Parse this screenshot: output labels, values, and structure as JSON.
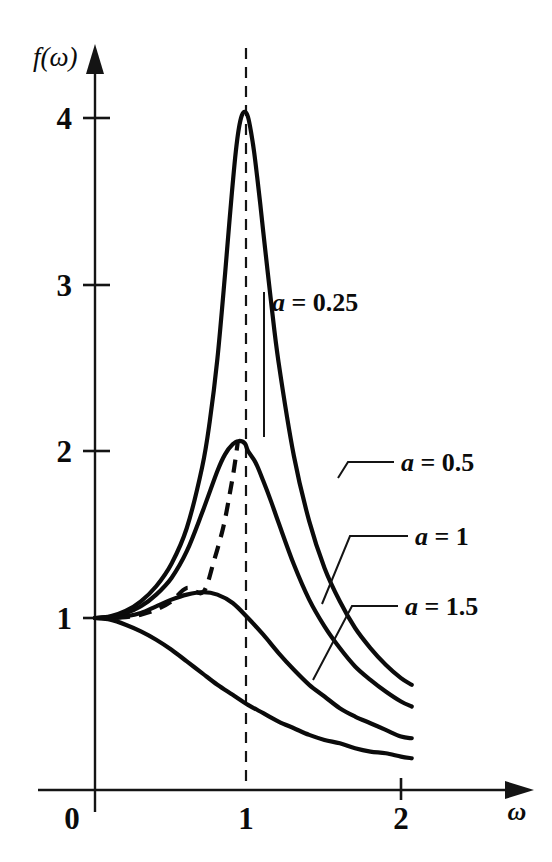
{
  "figure": {
    "name": "resonance-response-curves",
    "background_color": "#ffffff",
    "ink_color": "#0b0b0b"
  },
  "axes": {
    "y_title": "f(ω)",
    "x_title": "ω",
    "origin_label": "0",
    "y_ticks": [
      "1",
      "2",
      "3",
      "4"
    ],
    "x_ticks": [
      "1",
      "2"
    ]
  },
  "annotations": {
    "label_a_025": {
      "lhs": "a",
      "eq": " = ",
      "rhs": "0.25"
    },
    "label_a_05": {
      "lhs": "a",
      "eq": " = ",
      "rhs": "0.5"
    },
    "label_a_1": {
      "lhs": "a",
      "eq": " = ",
      "rhs": "1"
    },
    "label_a_15": {
      "lhs": "a",
      "eq": " = ",
      "rhs": "1.5"
    },
    "resonance_line": "ω = 1 dashed reference line",
    "locus": "dashed locus of maxima"
  },
  "chart_data": {
    "type": "line",
    "title": "",
    "xlabel": "ω",
    "ylabel": "f(ω)",
    "xlim": [
      0,
      2.2
    ],
    "ylim": [
      0,
      4.45
    ],
    "grid": false,
    "legend_position": "inline-labels",
    "x_ticks": [
      0,
      1,
      2
    ],
    "y_ticks": [
      1,
      2,
      3,
      4
    ],
    "formula": "f(w) = 1 / sqrt((1 - w^2)^2 + (a*w)^2)",
    "series": [
      {
        "name": "a = 0.25",
        "a": 0.25,
        "label": "a = 0.25",
        "style": "solid",
        "peak": {
          "x": 0.984,
          "y": 4.03
        },
        "x": [
          0,
          0.1,
          0.2,
          0.3,
          0.4,
          0.5,
          0.6,
          0.7,
          0.75,
          0.8,
          0.85,
          0.88,
          0.9,
          0.92,
          0.94,
          0.96,
          0.98,
          1.0,
          1.02,
          1.04,
          1.06,
          1.08,
          1.1,
          1.15,
          1.2,
          1.3,
          1.4,
          1.5,
          1.6,
          1.7,
          1.8,
          1.9,
          2.0,
          2.07
        ],
        "y": [
          1.0,
          1.01,
          1.042,
          1.1,
          1.19,
          1.325,
          1.539,
          1.902,
          2.177,
          2.552,
          3.059,
          3.39,
          3.6,
          3.79,
          3.93,
          4.01,
          4.031,
          4.0,
          3.91,
          3.79,
          3.64,
          3.48,
          3.31,
          2.9,
          2.53,
          1.97,
          1.58,
          1.3,
          1.1,
          0.94,
          0.82,
          0.72,
          0.64,
          0.6
        ]
      },
      {
        "name": "a = 0.5",
        "a": 0.5,
        "label": "a = 0.5",
        "style": "solid",
        "peak": {
          "x": 0.935,
          "y": 2.066
        },
        "x": [
          0,
          0.1,
          0.2,
          0.3,
          0.4,
          0.5,
          0.6,
          0.7,
          0.8,
          0.85,
          0.9,
          0.94,
          0.98,
          1.0,
          1.05,
          1.1,
          1.15,
          1.2,
          1.3,
          1.4,
          1.5,
          1.6,
          1.7,
          1.8,
          1.9,
          2.0,
          2.07
        ],
        "y": [
          1.0,
          1.007,
          1.028,
          1.07,
          1.14,
          1.24,
          1.4,
          1.63,
          1.88,
          1.98,
          2.04,
          2.06,
          2.045,
          2.0,
          1.93,
          1.82,
          1.7,
          1.57,
          1.32,
          1.11,
          0.95,
          0.82,
          0.71,
          0.63,
          0.56,
          0.5,
          0.47
        ]
      },
      {
        "name": "a = 1",
        "a": 1,
        "label": "a = 1",
        "style": "solid",
        "peak": {
          "x": 0.707,
          "y": 1.155
        },
        "x": [
          0,
          0.1,
          0.2,
          0.3,
          0.4,
          0.5,
          0.6,
          0.707,
          0.8,
          0.9,
          1.0,
          1.1,
          1.2,
          1.3,
          1.4,
          1.5,
          1.6,
          1.7,
          1.8,
          1.9,
          2.0,
          2.07
        ],
        "y": [
          1.0,
          1.0,
          1.01,
          1.03,
          1.07,
          1.11,
          1.14,
          1.155,
          1.14,
          1.09,
          1.0,
          0.9,
          0.79,
          0.69,
          0.6,
          0.53,
          0.46,
          0.41,
          0.37,
          0.33,
          0.29,
          0.28
        ]
      },
      {
        "name": "a = 1.5",
        "a": 1.5,
        "label": "a = 1.5",
        "style": "solid",
        "peak": {
          "x": 0.0,
          "y": 1.0
        },
        "x": [
          0,
          0.1,
          0.2,
          0.3,
          0.4,
          0.5,
          0.6,
          0.7,
          0.8,
          0.9,
          1.0,
          1.1,
          1.2,
          1.3,
          1.4,
          1.5,
          1.6,
          1.7,
          1.8,
          1.9,
          2.0,
          2.07
        ],
        "y": [
          1.0,
          0.99,
          0.96,
          0.92,
          0.87,
          0.81,
          0.74,
          0.67,
          0.6,
          0.54,
          0.48,
          0.43,
          0.38,
          0.34,
          0.3,
          0.27,
          0.25,
          0.22,
          0.2,
          0.19,
          0.17,
          0.16
        ]
      },
      {
        "name": "locus of maxima",
        "style": "dashed",
        "x": [
          0,
          0.1,
          0.2,
          0.3,
          0.4,
          0.5,
          0.6,
          0.707,
          0.78,
          0.84,
          0.88,
          0.91,
          0.935
        ],
        "y": [
          1.0,
          1.0,
          1.005,
          1.02,
          1.05,
          1.1,
          1.18,
          1.155,
          1.35,
          1.55,
          1.74,
          1.9,
          2.066
        ]
      }
    ],
    "reference_lines": [
      {
        "type": "vertical",
        "x": 1.0,
        "style": "dashed",
        "y_range": [
          0,
          4.45
        ]
      }
    ]
  }
}
